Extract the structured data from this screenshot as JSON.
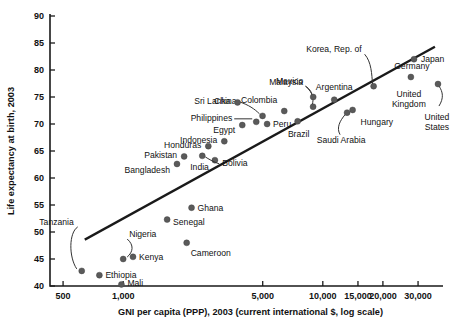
{
  "chart_data": {
    "type": "scatter",
    "title": "",
    "xlabel": "GNI per capita (PPP), 2003 (current international $, log scale)",
    "ylabel": "Life expectancy at birth, 2003",
    "xscale": "log",
    "yscale": "linear",
    "xlim": [
      430,
      40000
    ],
    "ylim": [
      40,
      90
    ],
    "grid": false,
    "legend": "none",
    "xticks": [
      500,
      1000,
      5000,
      10000,
      15000,
      20000,
      30000
    ],
    "xtick_labels": [
      "500",
      "1,000",
      "5,000",
      "10,000",
      "15,000",
      "20,000",
      "30,000"
    ],
    "yticks": [
      40,
      45,
      50,
      55,
      60,
      65,
      70,
      75,
      80,
      85,
      90
    ],
    "ytick_labels": [
      "40",
      "45",
      "50",
      "55",
      "60",
      "65",
      "70",
      "75",
      "80",
      "85",
      "90"
    ],
    "trendline": {
      "label": "fitted trend",
      "x_start": 650,
      "y_start": 48.7,
      "x_end": 36000,
      "y_end": 84.2
    },
    "points": [
      {
        "name": "Tanzania",
        "x": 620,
        "y": 42.8
      },
      {
        "name": "Ethiopia",
        "x": 760,
        "y": 42.0
      },
      {
        "name": "Mali",
        "x": 980,
        "y": 40.3
      },
      {
        "name": "Nigeria",
        "x": 1000,
        "y": 45.0
      },
      {
        "name": "Kenya",
        "x": 1120,
        "y": 45.4
      },
      {
        "name": "Bangladesh",
        "x": 1860,
        "y": 62.6
      },
      {
        "name": "Senegal",
        "x": 1660,
        "y": 52.3
      },
      {
        "name": "Ghana",
        "x": 2200,
        "y": 54.5
      },
      {
        "name": "Cameroon",
        "x": 2080,
        "y": 48.0
      },
      {
        "name": "Pakistan",
        "x": 2020,
        "y": 64.0
      },
      {
        "name": "India",
        "x": 2880,
        "y": 63.3
      },
      {
        "name": "Honduras",
        "x": 2670,
        "y": 65.9
      },
      {
        "name": "Bolivia",
        "x": 2490,
        "y": 64.1
      },
      {
        "name": "Indonesia",
        "x": 3210,
        "y": 66.8
      },
      {
        "name": "Egypt",
        "x": 3950,
        "y": 69.8
      },
      {
        "name": "Philippines",
        "x": 4640,
        "y": 70.4
      },
      {
        "name": "China",
        "x": 4990,
        "y": 71.5
      },
      {
        "name": "Sri Lanka",
        "x": 3740,
        "y": 74.0
      },
      {
        "name": "Peru",
        "x": 5260,
        "y": 70.0
      },
      {
        "name": "Colombia",
        "x": 6410,
        "y": 72.4
      },
      {
        "name": "Malaysia",
        "x": 8940,
        "y": 73.2
      },
      {
        "name": "Brazil",
        "x": 7480,
        "y": 70.5
      },
      {
        "name": "Mexico",
        "x": 8950,
        "y": 75.0
      },
      {
        "name": "Argentina",
        "x": 11410,
        "y": 74.5
      },
      {
        "name": "Saudi Arabia",
        "x": 13230,
        "y": 72.1
      },
      {
        "name": "Hungary",
        "x": 14100,
        "y": 72.6
      },
      {
        "name": "Korea, Rep. of",
        "x": 17970,
        "y": 77.0
      },
      {
        "name": "Japan",
        "x": 28620,
        "y": 82.0
      },
      {
        "name": "Germany",
        "x": 27610,
        "y": 78.7
      },
      {
        "name": "United States",
        "x": 37750,
        "y": 77.4
      }
    ]
  }
}
